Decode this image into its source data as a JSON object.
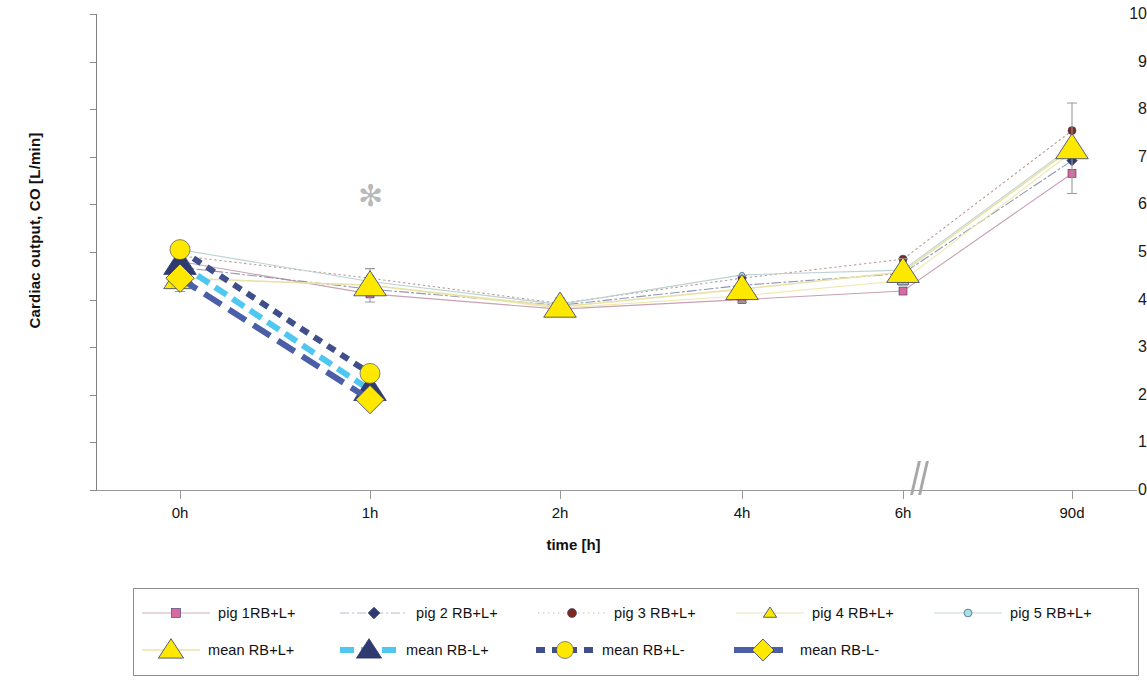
{
  "chart_data": {
    "type": "line",
    "title": "",
    "xlabel": "time [h]",
    "ylabel": "Cardiac output, CO [L/min]",
    "categories": [
      "0h",
      "1h",
      "2h",
      "4h",
      "6h",
      "90d"
    ],
    "ylim": [
      0,
      10
    ],
    "y_ticks": [
      0,
      1,
      2,
      3,
      4,
      5,
      6,
      7,
      8,
      9,
      10
    ],
    "grid": false,
    "legend_position": "bottom",
    "axis_break_between": [
      "6h",
      "90d"
    ],
    "annotations": [
      {
        "text": "✻",
        "x": "1h",
        "y": 6.15,
        "name": "significance-asterisk"
      }
    ],
    "series": [
      {
        "name": "pig 1RB+L+",
        "marker": "square",
        "marker_color": "#d96a9c",
        "line_color": "#c9a0b4",
        "line_style": "solid",
        "x": [
          "0h",
          "1h",
          "2h",
          "4h",
          "6h",
          "90d"
        ],
        "values": [
          4.8,
          4.12,
          3.8,
          4.0,
          4.18,
          6.65
        ]
      },
      {
        "name": "pig 2 RB+L+",
        "marker": "diamond",
        "marker_color": "#2f3a70",
        "line_color": "#8f97b5",
        "line_style": "dash-dot",
        "x": [
          "0h",
          "1h",
          "2h",
          "4h",
          "6h",
          "90d"
        ],
        "values": [
          4.68,
          4.22,
          3.88,
          4.3,
          4.55,
          6.92
        ]
      },
      {
        "name": "pig 3 RB+L+",
        "marker": "circle",
        "marker_color": "#7d2a1e",
        "line_color": "#b99a93",
        "line_style": "dotted",
        "x": [
          "0h",
          "1h",
          "2h",
          "4h",
          "6h",
          "90d"
        ],
        "values": [
          4.92,
          4.45,
          3.92,
          4.45,
          4.85,
          7.55
        ]
      },
      {
        "name": "pig 4 RB+L+",
        "marker": "triangle",
        "marker_color": "#ffe800",
        "line_color": "#efe9b0",
        "line_style": "solid",
        "x": [
          "0h",
          "1h",
          "2h",
          "4h",
          "6h",
          "90d"
        ],
        "values": [
          4.45,
          4.3,
          3.82,
          4.08,
          4.4,
          7.1
        ]
      },
      {
        "name": "pig 5 RB+L+",
        "marker": "dot",
        "marker_color": "#a6e2e2",
        "line_color": "#bcd2d2",
        "line_style": "solid",
        "x": [
          "0h",
          "1h",
          "2h",
          "4h",
          "6h",
          "90d"
        ],
        "values": [
          5.05,
          4.38,
          3.9,
          4.52,
          4.62,
          7.22
        ]
      },
      {
        "name": "mean RB+L+",
        "marker": "triangle",
        "marker_color": "#ffe800",
        "line_color": "#e8e2a8",
        "line_style": "solid",
        "x": [
          "0h",
          "1h",
          "2h",
          "4h",
          "6h",
          "90d"
        ],
        "values": [
          4.45,
          4.3,
          3.85,
          4.22,
          4.58,
          7.18
        ],
        "errors": [
          0.28,
          0.35,
          0.18,
          0.28,
          0.28,
          0.95
        ]
      },
      {
        "name": "mean RB-L+",
        "marker": "triangle",
        "marker_color": "#2f3a70",
        "line_color": "#4ec8f0",
        "line_style": "dashed",
        "x": [
          "0h",
          "1h"
        ],
        "values": [
          4.75,
          2.1
        ]
      },
      {
        "name": "mean RB+L-",
        "marker": "circle",
        "marker_color": "#ffe800",
        "line_color": "#3f4f8c",
        "line_style": "dashed-short",
        "x": [
          "0h",
          "1h"
        ],
        "values": [
          5.05,
          2.45
        ]
      },
      {
        "name": "mean RB-L-",
        "marker": "diamond",
        "marker_color": "#ffe800",
        "line_color": "#4a5fa8",
        "line_style": "dashed-long",
        "x": [
          "0h",
          "1h"
        ],
        "values": [
          4.45,
          1.9
        ]
      }
    ]
  },
  "axes": {
    "y_tick_labels": [
      "10",
      "9",
      "8",
      "7",
      "6",
      "5",
      "4",
      "3",
      "2",
      "1",
      "0"
    ],
    "x_tick_labels": [
      "0h",
      "1h",
      "2h",
      "4h",
      "6h",
      "90d"
    ],
    "y_title": "Cardiac output, CO [L/min]",
    "x_title": "time [h]"
  },
  "legend": {
    "row1": [
      {
        "label": "pig 1RB+L+",
        "marker": "square",
        "marker_color": "#d96a9c",
        "line_color": "#cbb0bd",
        "line_style": "solid"
      },
      {
        "label": "pig 2 RB+L+",
        "marker": "diamond",
        "marker_color": "#2f3a70",
        "line_color": "#b4bcd2",
        "line_style": "dash-dot"
      },
      {
        "label": "pig 3 RB+L+",
        "marker": "circle",
        "marker_color": "#7d2a1e",
        "line_color": "#d2b8b2",
        "line_style": "dotted"
      },
      {
        "label": "pig 4 RB+L+",
        "marker": "triangle",
        "marker_color": "#ffe800",
        "line_color": "#eae5bd",
        "line_style": "solid"
      },
      {
        "label": "pig 5 RB+L+",
        "marker": "dot",
        "marker_color": "#a6e2e2",
        "line_color": "#c6d8d8",
        "line_style": "solid"
      }
    ],
    "row2": [
      {
        "label": "mean RB+L+",
        "marker": "triangle",
        "marker_color": "#ffe800",
        "line_color": "#e8e2a8",
        "line_style": "solid"
      },
      {
        "label": "mean RB-L+",
        "marker": "triangle",
        "marker_color": "#2f3a70",
        "line_color": "#4ec8f0",
        "line_style": "dashed"
      },
      {
        "label": "mean RB+L-",
        "marker": "circle",
        "marker_color": "#ffe800",
        "line_color": "#3f4f8c",
        "line_style": "dashed-short"
      },
      {
        "label": "mean RB-L-",
        "marker": "diamond",
        "marker_color": "#ffe800",
        "line_color": "#4a5fa8",
        "line_style": "dashed-long"
      }
    ]
  }
}
